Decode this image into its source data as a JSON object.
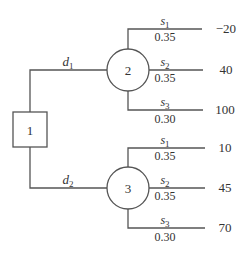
{
  "diagram": {
    "type": "decision-tree",
    "decision_node": {
      "id": "1",
      "label": "1"
    },
    "decisions": [
      {
        "label": "d",
        "sub": "1",
        "chance_node": "2"
      },
      {
        "label": "d",
        "sub": "2",
        "chance_node": "3"
      }
    ],
    "chance_nodes": [
      {
        "id": "2",
        "label": "2",
        "branches": [
          {
            "state": "s",
            "sub": "1",
            "prob": "0.35",
            "payoff": "−20"
          },
          {
            "state": "s",
            "sub": "2",
            "prob": "0.35",
            "payoff": "40"
          },
          {
            "state": "s",
            "sub": "3",
            "prob": "0.30",
            "payoff": "100"
          }
        ]
      },
      {
        "id": "3",
        "label": "3",
        "branches": [
          {
            "state": "s",
            "sub": "1",
            "prob": "0.35",
            "payoff": "10"
          },
          {
            "state": "s",
            "sub": "2",
            "prob": "0.35",
            "payoff": "45"
          },
          {
            "state": "s",
            "sub": "3",
            "prob": "0.30",
            "payoff": "70"
          }
        ]
      }
    ]
  }
}
